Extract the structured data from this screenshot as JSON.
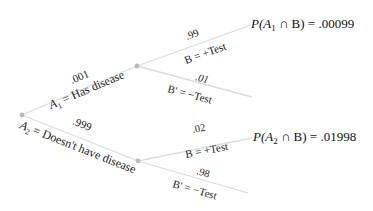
{
  "diagram": {
    "type": "probability-tree",
    "root": {
      "label": ""
    },
    "level1": [
      {
        "event": "A₁ = Has disease",
        "event_sym": "A",
        "event_sub": "1",
        "event_rest": " = Has disease",
        "probability": ".001"
      },
      {
        "event": "A₂ = Doesn't have disease",
        "event_sym": "A",
        "event_sub": "2",
        "event_rest": " = Doesn't have disease",
        "probability": ".999"
      }
    ],
    "level2": {
      "A1": [
        {
          "event": "B = +Test",
          "probability": ".99",
          "result": "P(A₁ ∩ B) = .00099",
          "result_prefix": "P(A",
          "result_sub": "1",
          "result_suffix": " ∩ B)  =  .00099"
        },
        {
          "event": "B' = −Test",
          "probability": ".01"
        }
      ],
      "A2": [
        {
          "event": "B = +Test",
          "probability": ".02",
          "result": "P(A₂ ∩ B) = .01998",
          "result_prefix": "P(A",
          "result_sub": "2",
          "result_suffix": " ∩ B)  =  .01998"
        },
        {
          "event": "B' = −Test",
          "probability": ".98"
        }
      ]
    },
    "colors": {
      "branch": "#dcdcdc",
      "node": "#b9b9b9",
      "text": "#222222"
    }
  }
}
